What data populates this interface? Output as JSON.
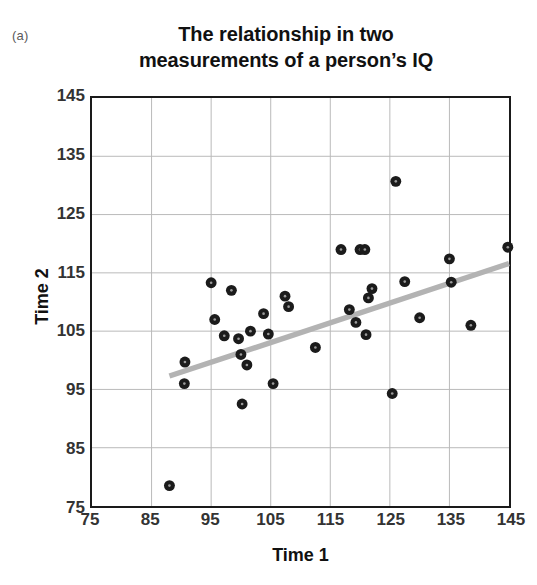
{
  "panel": {
    "label": "(a)"
  },
  "chart_data": {
    "type": "scatter",
    "title": "The relationship in two measurements of a person’s IQ",
    "title_lines": [
      "The relationship in two",
      "measurements of a person’s IQ"
    ],
    "xlabel": "Time 1",
    "ylabel": "Time 2",
    "xlim": [
      75,
      145
    ],
    "ylim": [
      75,
      145
    ],
    "xticks": [
      75,
      85,
      95,
      105,
      115,
      125,
      135,
      145
    ],
    "yticks": [
      75,
      85,
      95,
      105,
      115,
      125,
      135,
      145
    ],
    "grid": true,
    "legend": null,
    "marker": {
      "shape": "circle",
      "color": "#1b1b1b",
      "size": 11
    },
    "series": [
      {
        "name": "IQ measurements",
        "points": [
          [
            88.0,
            78.5
          ],
          [
            90.5,
            96.0
          ],
          [
            90.6,
            99.7
          ],
          [
            95.0,
            113.3
          ],
          [
            95.6,
            107.0
          ],
          [
            97.2,
            104.2
          ],
          [
            98.4,
            112.0
          ],
          [
            99.6,
            103.7
          ],
          [
            100.0,
            101.0
          ],
          [
            100.2,
            92.5
          ],
          [
            101.0,
            99.2
          ],
          [
            101.6,
            105.0
          ],
          [
            103.8,
            108.0
          ],
          [
            104.6,
            104.5
          ],
          [
            105.4,
            96.0
          ],
          [
            107.4,
            111.0
          ],
          [
            108.0,
            109.2
          ],
          [
            112.5,
            102.2
          ],
          [
            116.8,
            119.0
          ],
          [
            118.2,
            108.7
          ],
          [
            119.3,
            106.5
          ],
          [
            120.0,
            119.0
          ],
          [
            120.8,
            119.0
          ],
          [
            121.0,
            104.4
          ],
          [
            121.4,
            110.7
          ],
          [
            122.0,
            112.3
          ],
          [
            125.4,
            94.3
          ],
          [
            126.0,
            130.7
          ],
          [
            127.5,
            113.5
          ],
          [
            130.0,
            107.3
          ],
          [
            135.0,
            117.4
          ],
          [
            135.3,
            113.4
          ],
          [
            138.6,
            106.0
          ],
          [
            144.8,
            119.4
          ]
        ]
      }
    ],
    "trendline": {
      "name": "linear fit",
      "color": "#b3b3b3",
      "x1": 88.0,
      "y1": 97.3,
      "x2": 145.0,
      "y2": 116.6
    }
  }
}
